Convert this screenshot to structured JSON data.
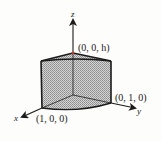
{
  "figure": {
    "axes": {
      "x": {
        "label": "x"
      },
      "y": {
        "label": "y"
      },
      "z": {
        "label": "z"
      }
    },
    "points": {
      "apex": {
        "label": "(0, 0, h)"
      },
      "x_corner": {
        "label": "(1, 0, 0)"
      },
      "y_corner": {
        "label": "(0, 1, 0)"
      }
    },
    "colors": {
      "line": "#1a1a1a",
      "fill": "#bdbdbd",
      "apex_marker": "#c0392b",
      "background": "#fdfdfb"
    }
  }
}
